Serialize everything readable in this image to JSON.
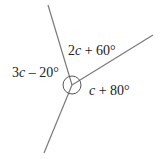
{
  "diagram": {
    "type": "angles-around-point",
    "center": [
      72,
      85
    ],
    "rays": [
      {
        "name": "ray-top",
        "end": [
          48,
          5
        ]
      },
      {
        "name": "ray-right",
        "end": [
          153,
          35
        ]
      },
      {
        "name": "ray-bottom",
        "end": [
          44,
          153
        ]
      }
    ],
    "angle_marker_radius": 9,
    "line_color": "#7a7a7a",
    "labels": [
      {
        "name": "label-top-right",
        "prefix": "2",
        "var": "c",
        "suffix": " + 60°",
        "x": 68,
        "y": 55
      },
      {
        "name": "label-left",
        "prefix": "3",
        "var": "c",
        "suffix": " – 20°",
        "x": 12,
        "y": 77
      },
      {
        "name": "label-bottom-right",
        "prefix": "",
        "var": "c",
        "suffix": " + 80°",
        "x": 89,
        "y": 95
      }
    ]
  }
}
